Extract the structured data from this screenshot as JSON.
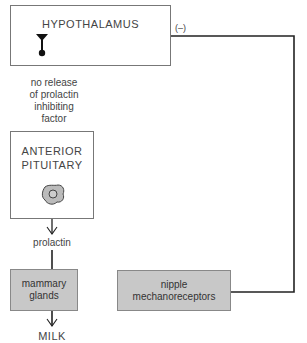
{
  "diagram": {
    "hypothalamus": {
      "label": "HYPOTHALAMUS"
    },
    "negative_feedback": {
      "label": "(–)"
    },
    "inhibition_note": {
      "line1": "no release",
      "line2": "of prolactin",
      "line3": "inhibiting",
      "line4": "factor"
    },
    "anterior_pituitary": {
      "line1": "ANTERIOR",
      "line2": "PITUITARY"
    },
    "hormone": {
      "label": "prolactin"
    },
    "mammary_glands": {
      "line1": "mammary",
      "line2": "glands"
    },
    "nipple_mechanoreceptors": {
      "line1": "nipple",
      "line2": "mechanoreceptors"
    },
    "output": {
      "label": "MILK"
    },
    "colors": {
      "box_fill_gray": "#c8c8c8",
      "line": "#222222",
      "border": "#777777"
    }
  }
}
